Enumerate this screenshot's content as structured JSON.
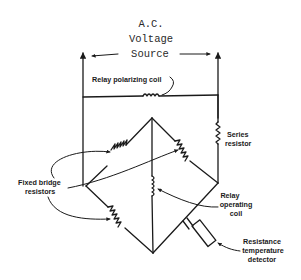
{
  "title": {
    "line1": "A.C.",
    "line2": "Voltage",
    "line3": "Source"
  },
  "labels": {
    "polarizing_coil": "Relay polarizing coil",
    "series_resistor_1": "Series",
    "series_resistor_2": "resistor",
    "fixed_bridge_1": "Fixed bridge",
    "fixed_bridge_2": "resistors",
    "operating_coil_1": "Relay",
    "operating_coil_2": "operating",
    "operating_coil_3": "coil",
    "rtd_1": "Resistance",
    "rtd_2": "temperature",
    "rtd_3": "detector"
  },
  "colors": {
    "ink": "#1a1a1a",
    "background": "#ffffff"
  }
}
